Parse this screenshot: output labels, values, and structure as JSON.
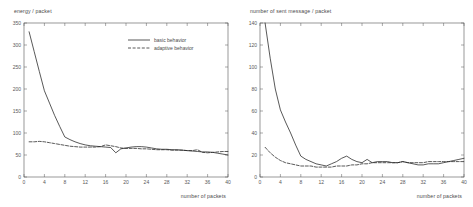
{
  "figure": {
    "background": "#ffffff",
    "axis_color": "#555555",
    "series_color": "#222222"
  },
  "charts": [
    {
      "id": "energy-per-packet",
      "ylabel": "energy / packet",
      "xlabel": "number of packets",
      "legend": [
        {
          "label": "basic behavior",
          "style": "solid"
        },
        {
          "label": "adaptive behavior",
          "style": "dashed"
        }
      ],
      "yticks": [
        "0",
        "50",
        "100",
        "150",
        "200",
        "250",
        "300",
        "350"
      ],
      "xticks": [
        "0",
        "4",
        "8",
        "12",
        "16",
        "20",
        "24",
        "28",
        "32",
        "36",
        "40"
      ],
      "chart_data": {
        "type": "line",
        "title": "",
        "xlabel": "number of packets",
        "ylabel": "energy / packet",
        "xlim": [
          0,
          40
        ],
        "ylim": [
          0,
          350
        ],
        "grid": false,
        "legend_position": "upper-right",
        "x": [
          1,
          2,
          3,
          4,
          5,
          6,
          7,
          8,
          9,
          10,
          11,
          12,
          13,
          14,
          15,
          16,
          17,
          18,
          19,
          20,
          21,
          22,
          23,
          24,
          25,
          26,
          27,
          28,
          29,
          30,
          31,
          32,
          33,
          34,
          35,
          36,
          37,
          38,
          39,
          40
        ],
        "series": [
          {
            "name": "basic behavior",
            "style": "solid",
            "values": [
              330,
              285,
              240,
              196,
              168,
              140,
              115,
              91,
              85,
              80,
              76,
              73,
              71,
              70,
              69,
              68,
              67,
              55,
              64,
              66,
              68,
              69,
              69,
              68,
              66,
              64,
              63,
              63,
              62,
              62,
              61,
              60,
              59,
              58,
              57,
              57,
              56,
              54,
              52,
              50
            ]
          },
          {
            "name": "adaptive behavior",
            "style": "dashed",
            "values": [
              80,
              80,
              81,
              80,
              78,
              76,
              74,
              72,
              70,
              69,
              68,
              68,
              68,
              68,
              69,
              73,
              71,
              69,
              66,
              65,
              65,
              65,
              64,
              64,
              63,
              62,
              62,
              62,
              61,
              61,
              61,
              60,
              60,
              62,
              56,
              55,
              56,
              57,
              58,
              58
            ]
          }
        ]
      }
    },
    {
      "id": "sent-message-per-packet",
      "ylabel": "number of sent message / packet",
      "xlabel": "number of packets",
      "legend": [],
      "yticks": [
        "0",
        "20",
        "40",
        "60",
        "80",
        "100",
        "120",
        "140"
      ],
      "xticks": [
        "0",
        "4",
        "8",
        "12",
        "16",
        "20",
        "24",
        "28",
        "32",
        "36",
        "40"
      ],
      "chart_data": {
        "type": "line",
        "title": "",
        "xlabel": "number of packets",
        "ylabel": "number of sent message / packet",
        "xlim": [
          0,
          40
        ],
        "ylim": [
          0,
          140
        ],
        "grid": false,
        "legend_position": "none",
        "x": [
          1,
          2,
          3,
          4,
          5,
          6,
          7,
          8,
          9,
          10,
          11,
          12,
          13,
          14,
          15,
          16,
          17,
          18,
          19,
          20,
          21,
          22,
          23,
          24,
          25,
          26,
          27,
          28,
          29,
          30,
          31,
          32,
          33,
          34,
          35,
          36,
          37,
          38,
          39,
          40
        ],
        "series": [
          {
            "name": "basic behavior",
            "style": "solid",
            "values": [
              140,
              108,
              80,
              61,
              50,
              40,
              29,
              19,
              16,
              14,
              12,
              11,
              10,
              12,
              14,
              17,
              19,
              16,
              14,
              13,
              16,
              13,
              14,
              14,
              14,
              13,
              13,
              14,
              13,
              12,
              11,
              11,
              12,
              12,
              12,
              13,
              14,
              15,
              16,
              17
            ]
          },
          {
            "name": "adaptive behavior",
            "style": "dashed",
            "values": [
              27,
              22,
              18,
              15,
              13,
              12,
              11,
              10,
              10,
              10,
              9,
              9,
              9,
              9,
              10,
              10,
              10,
              11,
              11,
              12,
              12,
              13,
              13,
              13,
              13,
              13,
              13,
              14,
              13,
              13,
              13,
              13,
              14,
              14,
              14,
              14,
              14,
              14,
              14,
              14
            ]
          }
        ]
      }
    }
  ]
}
